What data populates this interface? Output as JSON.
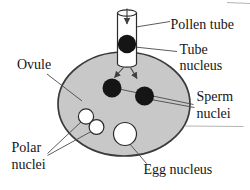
{
  "diagram": {
    "labels": {
      "pollen_tube": "Pollen tube",
      "tube_nucleus": {
        "line1": "Tube",
        "line2": "nucleus"
      },
      "ovule": "Ovule",
      "sperm_nuclei": {
        "line1": "Sperm",
        "line2": "nuclei"
      },
      "polar_nuclei": {
        "line1": "Polar",
        "line2": "nuclei"
      },
      "egg_nucleus": "Egg nucleus"
    },
    "colors": {
      "background": "#ffffff",
      "ovule_fill": "#c8c8c8",
      "nucleus_fill_dark": "#151515",
      "nucleus_fill_light": "#ffffff",
      "leader_line": "#4a4a4a",
      "faint_line": "#b4b4b4",
      "text": "#151515"
    }
  }
}
